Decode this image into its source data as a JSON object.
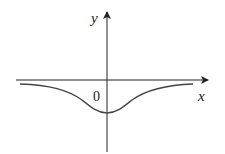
{
  "figure": {
    "type": "function-graph",
    "axes": {
      "x_label": "x",
      "y_label": "y",
      "origin_label": "0"
    },
    "curve": {
      "description": "bell-shaped curve below the x-axis, minimum at x=0, approaching y=0 asymptotically",
      "color": "#444444"
    },
    "axis_color": "#222222"
  }
}
